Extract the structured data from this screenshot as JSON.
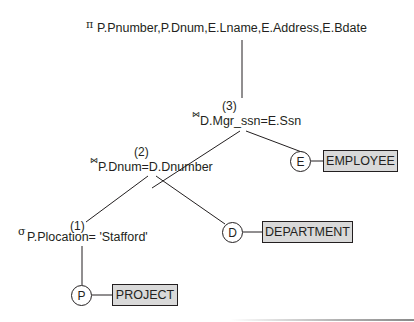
{
  "diagram": {
    "type": "query-tree",
    "nodes": {
      "project": {
        "symbol": "π",
        "subscript": "P.Pnumber,P.Dnum,E.Lname,E.Address,E.Bdate"
      },
      "join3": {
        "step": "(3)",
        "symbol": "⋈",
        "condition": "D.Mgr_ssn=E.Ssn"
      },
      "join2": {
        "step": "(2)",
        "symbol": "⋈",
        "condition": "P.Dnum=D.Dnumber"
      },
      "select1": {
        "step": "(1)",
        "symbol": "σ",
        "condition": "P.Plocation= 'Stafford'"
      }
    },
    "leaves": [
      {
        "alias": "E",
        "relation": "EMPLOYEE"
      },
      {
        "alias": "D",
        "relation": "DEPARTMENT"
      },
      {
        "alias": "P",
        "relation": "PROJECT"
      }
    ],
    "colors": {
      "line": "#231f20",
      "relation_fill": "#d9d9d9"
    }
  }
}
